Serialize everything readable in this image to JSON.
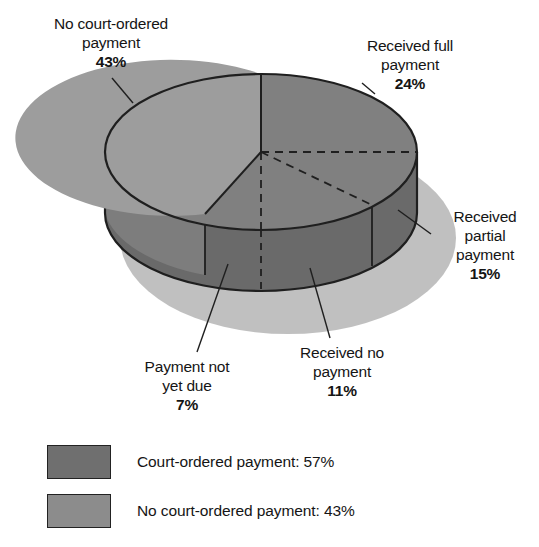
{
  "chart_data": {
    "type": "pie",
    "title": "",
    "subtitle": "",
    "xlabel": "",
    "ylabel": "",
    "grid": false,
    "legend_position": "bottom-left",
    "three_d": true,
    "categories": [
      "Received full payment",
      "Received partial payment",
      "Received no payment",
      "Payment not yet due",
      "No court-ordered payment"
    ],
    "values": [
      24,
      15,
      11,
      7,
      43
    ],
    "units": "percent",
    "groups": [
      {
        "name": "Court-ordered payment",
        "value": 57,
        "members": [
          "Received full payment",
          "Received partial payment",
          "Received no payment",
          "Payment not yet due"
        ]
      },
      {
        "name": "No court-ordered payment",
        "value": 43,
        "members": [
          "No court-ordered payment"
        ]
      }
    ],
    "slices": [
      {
        "label": "Received full payment",
        "value": 24,
        "display": "24%",
        "group": "Court-ordered payment"
      },
      {
        "label": "Received partial payment",
        "value": 15,
        "display": "15%",
        "group": "Court-ordered payment"
      },
      {
        "label": "Received no payment",
        "value": 11,
        "display": "11%",
        "group": "Court-ordered payment"
      },
      {
        "label": "Payment not yet due",
        "value": 7,
        "display": "7%",
        "group": "Court-ordered payment"
      },
      {
        "label": "No court-ordered payment",
        "value": 43,
        "display": "43%",
        "group": "No court-ordered payment"
      }
    ]
  },
  "callouts": {
    "no_court_ordered": "No court-ordered\npayment\n43%",
    "received_full": "Received full\npayment\n24%",
    "received_partial": "Received\npartial\npayment\n15%",
    "payment_not_yet_due": "Payment not\nyet due\n7%",
    "received_no_payment": "Received no\npayment\n11%"
  },
  "legend": {
    "items": [
      {
        "label": "Court-ordered payment: 57%",
        "color": "#6f6f6f"
      },
      {
        "label": "No court-ordered payment: 43%",
        "color": "#8c8c8c"
      }
    ]
  },
  "colors": {
    "court_ordered_top": "#808080",
    "no_court_ordered_top": "#9d9d9d",
    "wall_court_ordered": "#6a6a6a",
    "wall_no_court_ordered": "#7d7d7d",
    "shadow": "#bdbdbd",
    "outline": "#1f1f1f",
    "background": "#ffffff"
  }
}
